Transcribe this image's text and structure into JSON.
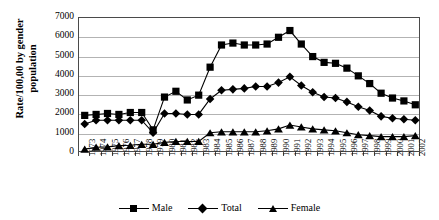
{
  "chart_data": {
    "type": "line",
    "title": "",
    "xlabel": "",
    "ylabel": "Rate/100,00 by gender population",
    "ylabel_lines": [
      "Rate/100,00 by gender",
      "population"
    ],
    "ylim": [
      0,
      7000
    ],
    "ytick_step": 1000,
    "yticks": [
      "7000",
      "6000",
      "5000",
      "4000",
      "3000",
      "2000",
      "1000",
      "0"
    ],
    "ytick_values": [
      7000,
      6000,
      5000,
      4000,
      3000,
      2000,
      1000,
      0
    ],
    "grid": true,
    "legend_position": "bottom",
    "categories": [
      "1973",
      "1974",
      "1975",
      "1976",
      "1977",
      "1978",
      "1979",
      "1980",
      "1981",
      "1982",
      "1983",
      "1984",
      "1985",
      "1986",
      "1987",
      "1988",
      "1989",
      "1990",
      "1991",
      "1992",
      "1993",
      "1994",
      "1995",
      "1996",
      "1997",
      "1998",
      "1999",
      "2000",
      "2001",
      "2002"
    ],
    "series": [
      {
        "name": "Male",
        "marker": "square",
        "values": [
          1950,
          2000,
          2050,
          2000,
          2100,
          2100,
          1200,
          2900,
          3200,
          2750,
          3000,
          4450,
          5600,
          5700,
          5600,
          5600,
          5650,
          6000,
          6350,
          5650,
          5000,
          4700,
          4650,
          4400,
          4000,
          3600,
          3100,
          2850,
          2700,
          2500
        ]
      },
      {
        "name": "Total",
        "marker": "diamond",
        "values": [
          1500,
          1700,
          1700,
          1700,
          1700,
          1700,
          1050,
          2050,
          2050,
          2000,
          2000,
          2800,
          3250,
          3300,
          3350,
          3450,
          3450,
          3650,
          3950,
          3500,
          3150,
          2900,
          2850,
          2650,
          2400,
          2200,
          1900,
          1800,
          1750,
          1700
        ]
      },
      {
        "name": "Female",
        "marker": "triangle",
        "values": [
          200,
          300,
          320,
          380,
          400,
          450,
          450,
          550,
          600,
          600,
          600,
          1050,
          1100,
          1100,
          1100,
          1100,
          1150,
          1250,
          1450,
          1350,
          1250,
          1200,
          1150,
          1050,
          950,
          900,
          850,
          850,
          850,
          900
        ]
      }
    ]
  },
  "legend": {
    "items": [
      {
        "label": "Male",
        "marker": "square-marker"
      },
      {
        "label": "Total",
        "marker": "diamond-marker"
      },
      {
        "label": "Female",
        "marker": "triangle-marker"
      }
    ]
  },
  "colors": {
    "series": "#000000",
    "grid": "#b3b3b3",
    "axis": "#4a4a4a",
    "background": "#ffffff"
  }
}
